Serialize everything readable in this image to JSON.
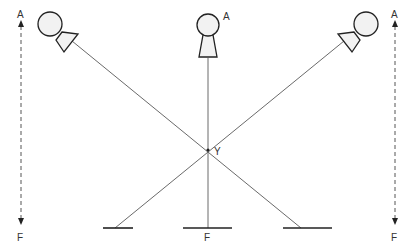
{
  "diagram": {
    "type": "crossed-lines-of-sight",
    "labels": {
      "left_top": "A",
      "left_bottom": "F",
      "center_top": "A",
      "center_bottom": "F",
      "intersection": "Y",
      "right_top": "A",
      "right_bottom": "F"
    },
    "figures": [
      {
        "name": "left-viewer",
        "direction": "down-right"
      },
      {
        "name": "center-viewer",
        "direction": "down"
      },
      {
        "name": "right-viewer",
        "direction": "down-left"
      }
    ],
    "arrows": [
      {
        "name": "left-axis",
        "from": "A",
        "to": "F",
        "style": "dashed-double-headed"
      },
      {
        "name": "right-axis",
        "from": "A",
        "to": "F",
        "style": "dashed-double-headed"
      }
    ],
    "colors": {
      "stroke": "#222222",
      "line": "#6a6a6a",
      "fill": "#f2f2f2",
      "background": "#ffffff"
    }
  }
}
